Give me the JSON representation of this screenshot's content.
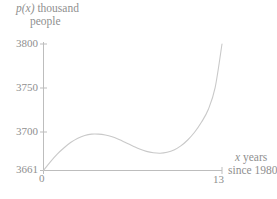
{
  "figure": {
    "background": "#ffffff",
    "line_color": "#c9c9c9",
    "axis_color": "#bdbdbd",
    "text_color": "#8f8f8f"
  },
  "axes": {
    "y_caption_line1_var": "p(x)",
    "y_caption_line1_rest": " thousand",
    "y_caption_line2": "people",
    "x_caption_line1_var": "x",
    "x_caption_line1_rest": " years",
    "x_caption_line2": "since 1980",
    "y_ticks": [
      "3800",
      "3750",
      "3700",
      "3661"
    ],
    "x_ticks": [
      "0",
      "13"
    ]
  },
  "chart_data": {
    "type": "line",
    "title": "",
    "xlabel": "x years since 1980",
    "ylabel": "p(x) thousand people",
    "xlim": [
      0,
      13
    ],
    "ylim": [
      3661,
      3800
    ],
    "grid": false,
    "legend": null,
    "xtick_values": [
      0,
      13
    ],
    "ytick_values": [
      3661,
      3700,
      3750,
      3800
    ],
    "annotations": [],
    "series": [
      {
        "name": "p(x)",
        "x": [
          0,
          0.5,
          1,
          1.5,
          2,
          2.5,
          3,
          3.5,
          4,
          4.5,
          5,
          5.5,
          6,
          6.5,
          7,
          7.5,
          8,
          8.5,
          9,
          9.5,
          10,
          10.5,
          11,
          11.5,
          12,
          12.5,
          13
        ],
        "y": [
          3661,
          3670.5,
          3679,
          3686,
          3692,
          3696.5,
          3699.5,
          3701,
          3701,
          3700,
          3698,
          3695,
          3691.5,
          3688,
          3684.5,
          3682,
          3680.5,
          3680,
          3681,
          3683.5,
          3688,
          3694.5,
          3703,
          3714,
          3728,
          3752,
          3800
        ]
      }
    ],
    "features": {
      "start_value": 3661,
      "local_max": {
        "x": 3.7,
        "y": 3701
      },
      "local_min": {
        "x": 8.5,
        "y": 3680
      },
      "end_value": 3800
    }
  }
}
